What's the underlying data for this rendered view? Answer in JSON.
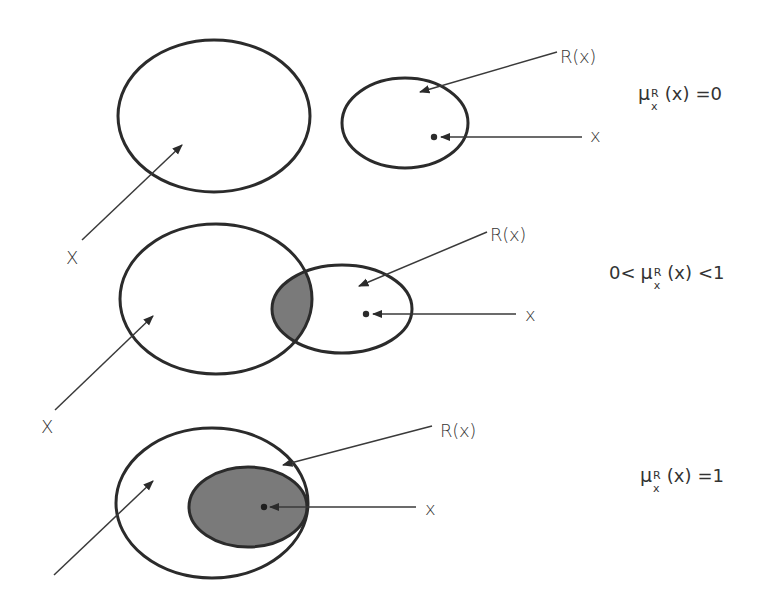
{
  "figure": {
    "colors": {
      "stroke": "#2b2b2b",
      "fill_overlap": "#7a7a7a",
      "background": "#ffffff",
      "text": "#333333"
    },
    "panels": [
      {
        "id": "no-overlap",
        "set_label": "X",
        "relation_label": "R(x)",
        "element_label": "x",
        "formula": {
          "prefix": "",
          "symbol": "μ",
          "superscript": "R",
          "subscript": "x",
          "argument": "(x)",
          "suffix": "=0"
        }
      },
      {
        "id": "partial-overlap",
        "set_label": "X",
        "relation_label": "R(x)",
        "element_label": "x",
        "formula": {
          "prefix": "0<",
          "symbol": "μ",
          "superscript": "R",
          "subscript": "x",
          "argument": "(x)",
          "suffix": "<1"
        }
      },
      {
        "id": "full-containment",
        "set_label": "",
        "relation_label": "R(x)",
        "element_label": "x",
        "formula": {
          "prefix": "",
          "symbol": "μ",
          "superscript": "R",
          "subscript": "x",
          "argument": "(x)",
          "suffix": "=1"
        }
      }
    ]
  }
}
